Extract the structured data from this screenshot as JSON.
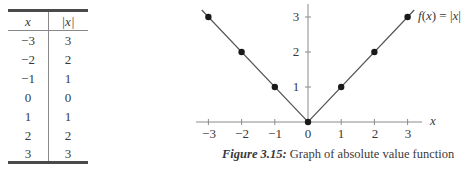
{
  "table": {
    "headers": [
      "x",
      "|x|"
    ],
    "rows": [
      [
        "−3",
        "3"
      ],
      [
        "−2",
        "2"
      ],
      [
        "−1",
        "1"
      ],
      [
        "0",
        "0"
      ],
      [
        "1",
        "1"
      ],
      [
        "2",
        "2"
      ],
      [
        "3",
        "3"
      ]
    ]
  },
  "chart": {
    "function_label": "f(x) = |x|",
    "function_label_parts": {
      "f": "f",
      "open": "(",
      "x": "x",
      "close": ") = |",
      "x2": "x",
      "end": "|"
    },
    "x_axis_label": "x",
    "x_tick_labels": [
      "−3",
      "−2",
      "−1",
      "0",
      "1",
      "2",
      "3"
    ],
    "y_tick_labels": [
      "1",
      "2",
      "3"
    ],
    "caption_figure": "Figure 3.15:",
    "caption_text": "Graph of absolute value function",
    "line_color": "#555555",
    "point_color": "#1a1a1a"
  },
  "chart_data": {
    "type": "line",
    "title": "Figure 3.15: Graph of absolute value function",
    "xlabel": "x",
    "ylabel": "",
    "series": [
      {
        "name": "f(x) = |x|",
        "x": [
          -3,
          -2,
          -1,
          0,
          1,
          2,
          3
        ],
        "values": [
          3,
          2,
          1,
          0,
          1,
          2,
          3
        ]
      }
    ],
    "x_ticks": [
      -3,
      -2,
      -1,
      0,
      1,
      2,
      3
    ],
    "y_ticks": [
      1,
      2,
      3
    ],
    "xlim": [
      -3.2,
      3.4
    ],
    "ylim": [
      0,
      3.3
    ],
    "grid": false,
    "markers": true,
    "legend": {
      "position": "inline-top-right",
      "entries": [
        "f(x) = |x|"
      ]
    }
  }
}
